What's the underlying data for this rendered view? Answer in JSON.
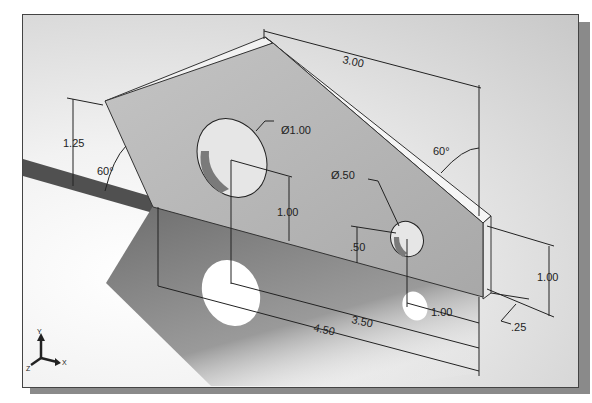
{
  "viewport": {
    "title": "Isometric part with dimensions",
    "background_color": "#d9d9d9",
    "part_color": "#b8b8b8"
  },
  "dimensions": {
    "top_width": "3.00",
    "left_height": "1.25",
    "left_angle": "60°",
    "right_angle": "60°",
    "big_hole_diameter": "Ø1.00",
    "big_hole_height": "1.00",
    "small_hole_diameter": "Ø.50",
    "small_hole_height": ".50",
    "right_height": "1.00",
    "small_hole_offset": "1.00",
    "hole_spacing": "3.50",
    "total_width": "4.50",
    "thickness": ".25"
  },
  "triad": {
    "x_label": "X",
    "y_label": "Y",
    "z_label": "Z"
  }
}
